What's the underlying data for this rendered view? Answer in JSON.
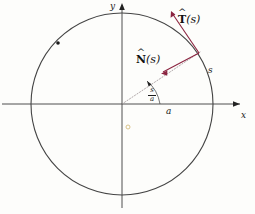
{
  "figure": {
    "background_color": "#fdfdfb",
    "axis_color": "#3a3a3a",
    "circle_color": "#444444",
    "vector_color": "#8b2440",
    "radius_line_color": "#9a8f92",
    "marker_color": "#1a1a1a",
    "interior_dot_color": "#d9c38a"
  },
  "axes": {
    "x_label": "x",
    "y_label": "y",
    "origin": {
      "x": 122,
      "y": 104
    }
  },
  "circle": {
    "center_x": 122,
    "center_y": 104,
    "radius": 91,
    "radius_label": "a"
  },
  "arc_angle": {
    "numerator": "s",
    "denominator": "a"
  },
  "arclength": {
    "label": "s"
  },
  "vectors": [
    {
      "name": "tangent",
      "hat": "^",
      "symbol": "T",
      "argument": "(s)",
      "label_text": "T(s)",
      "from_x": 199,
      "from_y": 53,
      "to_x": 172,
      "to_y": 12
    },
    {
      "name": "normal",
      "hat": "^",
      "symbol": "N",
      "argument": "(s)",
      "label_text": "N(s)",
      "from_x": 199,
      "from_y": 53,
      "to_x": 162,
      "to_y": 73
    }
  ],
  "markers": [
    {
      "name": "circle-point-upper-left",
      "x": 58,
      "y": 43
    },
    {
      "name": "interior-dot",
      "x": 128,
      "y": 127
    }
  ]
}
